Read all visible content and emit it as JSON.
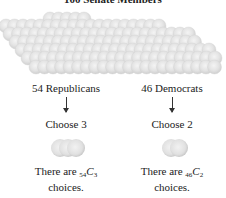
{
  "title": "100 Senate Members",
  "pile": {
    "total_members": 100,
    "color": "#e6e6e6"
  },
  "groups": [
    {
      "party_label": "54 Republicans",
      "choose_label": "Choose 3",
      "balls": 3,
      "desc_prefix": "There are ",
      "n": "54",
      "k": "3",
      "c_symbol": "C",
      "desc_suffix": "choices."
    },
    {
      "party_label": "46 Democrats",
      "choose_label": "Choose 2",
      "balls": 2,
      "desc_prefix": "There are ",
      "n": "46",
      "k": "2",
      "c_symbol": "C",
      "desc_suffix": "choices."
    }
  ]
}
